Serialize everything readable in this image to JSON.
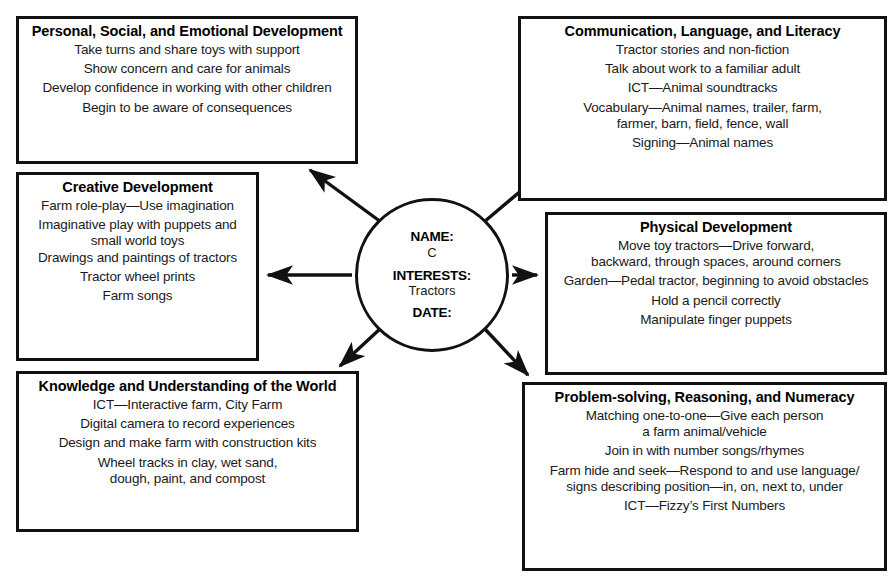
{
  "diagram": {
    "kind": "spider-web-planning-diagram",
    "hub": {
      "name_label": "NAME:",
      "name_value": "C",
      "interests_label": "INTERESTS:",
      "interests_value": "Tractors",
      "date_label": "DATE:"
    },
    "boxes": [
      {
        "id": "pse",
        "title": "Personal, Social, and Emotional Development",
        "lines": [
          "Take turns and share toys with support",
          "Show concern and care for animals",
          "Develop confidence in working with other children",
          "Begin to be aware of consequences"
        ]
      },
      {
        "id": "creative",
        "title": "Creative Development",
        "lines": [
          "Farm role-play—Use imagination",
          "Imaginative play with puppets and",
          "small world toys",
          "Drawings and paintings of tractors",
          "Tractor wheel prints",
          "Farm songs"
        ]
      },
      {
        "id": "knowledge",
        "title": "Knowledge and Understanding of the World",
        "lines": [
          "ICT—Interactive farm, City Farm",
          "Digital camera to record experiences",
          "Design and make farm with construction kits",
          "Wheel tracks in clay, wet sand,",
          "dough, paint, and compost"
        ]
      },
      {
        "id": "communication",
        "title": "Communication, Language, and Literacy",
        "lines": [
          "Tractor stories and non-fiction",
          "Talk about work to a familiar adult",
          "ICT—Animal soundtracks",
          "Vocabulary—Animal names, trailer, farm,",
          "farmer, barn, field, fence, wall",
          "Signing—Animal names"
        ]
      },
      {
        "id": "physical",
        "title": "Physical Development",
        "lines": [
          "Move toy tractors—Drive forward,",
          "backward, through spaces, around corners",
          "Garden—Pedal tractor, beginning to avoid obstacles",
          "Hold a pencil correctly",
          "Manipulate finger puppets"
        ]
      },
      {
        "id": "problem",
        "title": "Problem-solving, Reasoning, and Numeracy",
        "lines": [
          "Matching one-to-one—Give each person",
          "a farm animal/vehicle",
          "Join in with number songs/rhymes",
          "Farm hide and seek—Respond to and use language/",
          "signs describing position—in, on, next to, under",
          "ICT—Fizzy’s First Numbers"
        ]
      }
    ],
    "colors": {
      "background": "#ffffff",
      "stroke": "#111111",
      "text": "#1a1a1a"
    }
  }
}
